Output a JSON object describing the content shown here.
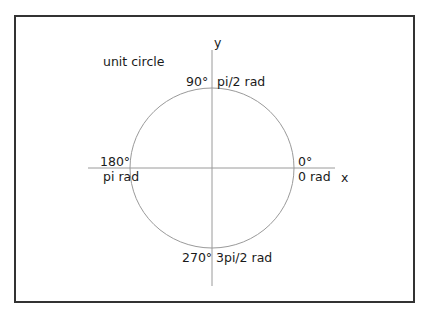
{
  "title": "unit circle",
  "axes": {
    "x_label": "x",
    "y_label": "y"
  },
  "angles": [
    {
      "degrees": "0°",
      "radians": "0 rad"
    },
    {
      "degrees": "90°",
      "radians": "pi/2 rad"
    },
    {
      "degrees": "180°",
      "radians": "pi rad"
    },
    {
      "degrees": "270°",
      "radians": "3pi/2 rad"
    }
  ],
  "colors": {
    "frame": "#333333",
    "circle": "#9a9a9a",
    "axes": "#9a9a9a",
    "text": "#1a1a1a"
  }
}
